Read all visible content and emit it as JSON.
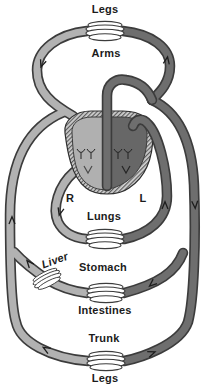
{
  "diagram": {
    "type": "circulatory-system-loop-diagram",
    "labels": {
      "legs_top": "Legs",
      "arms": "Arms",
      "heart_right": "R",
      "heart_left": "L",
      "lungs": "Lungs",
      "liver": "Liver",
      "stomach": "Stomach",
      "intestines": "Intestines",
      "trunk": "Trunk",
      "legs_bottom": "Legs"
    },
    "colors": {
      "background": "#ffffff",
      "vein_light": "#b2b2b2",
      "artery_dark": "#6e6e6e",
      "tube_outline": "#3c3c3c",
      "heart_left_fill": "#b0b0b0",
      "heart_right_fill": "#676767",
      "heart_wall_hatch": "#cfcfcf",
      "text": "#1b1b1b"
    },
    "elements": {
      "capillary_beds": [
        "arms-legs-top",
        "lungs",
        "liver",
        "stomach-intestines",
        "trunk-legs-bottom"
      ],
      "heart_chambers": [
        "R",
        "L"
      ]
    }
  }
}
